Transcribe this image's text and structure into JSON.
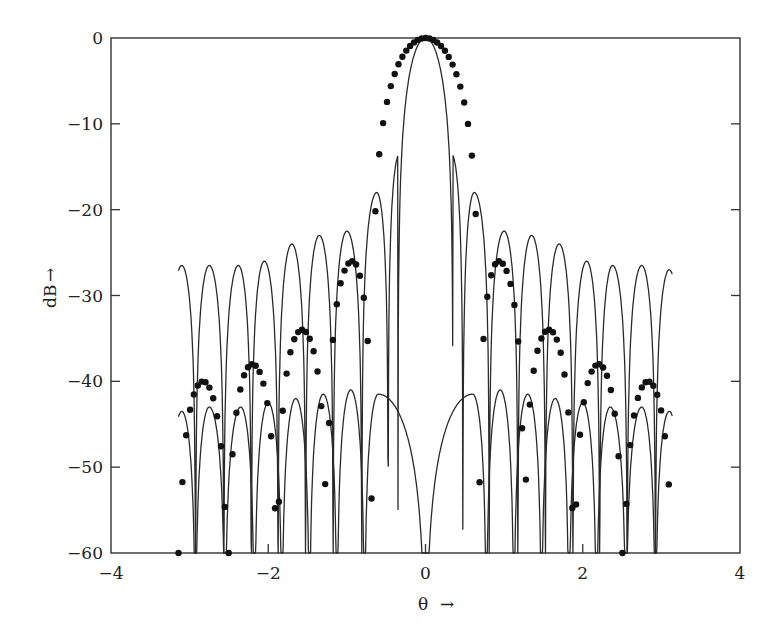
{
  "chart_data": {
    "type": "line",
    "title": "",
    "xlabel": "θ",
    "ylabel": "dB",
    "xlim": [
      -4,
      4
    ],
    "ylim": [
      -60,
      0
    ],
    "x_ticks": [
      -4,
      -2,
      0,
      2,
      4
    ],
    "x_tick_labels": [
      "−4",
      "−2",
      "0",
      "2",
      "4"
    ],
    "y_ticks": [
      0,
      -10,
      -20,
      -30,
      -40,
      -50,
      -60
    ],
    "y_tick_labels": [
      "0",
      "−10",
      "−20",
      "−30",
      "−40",
      "−50",
      "−60"
    ],
    "grid": false,
    "legend": null,
    "x_domain": [
      -3.1416,
      3.1416
    ],
    "floor_db": -60,
    "series": [
      {
        "name": "upper-solid-pattern",
        "style": "line",
        "main_lobe_peak_db": 0,
        "first_null": 0.35,
        "sidelobe_peaks": [
          {
            "theta": -3.1,
            "db": -26.5
          },
          {
            "theta": -2.75,
            "db": -26.5
          },
          {
            "theta": -2.38,
            "db": -26.5
          },
          {
            "theta": -2.05,
            "db": -26.0
          },
          {
            "theta": -1.7,
            "db": -24.0
          },
          {
            "theta": -1.35,
            "db": -23.0
          },
          {
            "theta": -1.0,
            "db": -22.5
          },
          {
            "theta": -0.62,
            "db": -18.0
          },
          {
            "theta": -0.33,
            "db": -13.5
          },
          {
            "theta": 0.33,
            "db": -13.5
          },
          {
            "theta": 0.62,
            "db": -18.0
          },
          {
            "theta": 1.0,
            "db": -22.5
          },
          {
            "theta": 1.35,
            "db": -23.0
          },
          {
            "theta": 1.7,
            "db": -24.0
          },
          {
            "theta": 2.05,
            "db": -26.0
          },
          {
            "theta": 2.38,
            "db": -26.5
          },
          {
            "theta": 2.75,
            "db": -26.5
          },
          {
            "theta": 3.1,
            "db": -27.0
          }
        ]
      },
      {
        "name": "lower-solid-pattern",
        "style": "line",
        "sidelobe_level_db": -42,
        "sidelobe_peaks": [
          {
            "theta": -3.1,
            "db": -43.5
          },
          {
            "theta": -2.75,
            "db": -43.0
          },
          {
            "theta": -2.35,
            "db": -43.0
          },
          {
            "theta": -2.0,
            "db": -42.5
          },
          {
            "theta": -1.65,
            "db": -42.0
          },
          {
            "theta": -1.3,
            "db": -41.5
          },
          {
            "theta": -0.95,
            "db": -41.0
          },
          {
            "theta": -0.6,
            "db": -41.5
          },
          {
            "theta": 0.6,
            "db": -41.5
          },
          {
            "theta": 0.95,
            "db": -41.0
          },
          {
            "theta": 1.3,
            "db": -41.5
          },
          {
            "theta": 1.65,
            "db": -42.0
          },
          {
            "theta": 2.0,
            "db": -42.5
          },
          {
            "theta": 2.35,
            "db": -43.0
          },
          {
            "theta": 2.75,
            "db": -43.0
          },
          {
            "theta": 3.1,
            "db": -43.5
          }
        ]
      },
      {
        "name": "dotted-pattern",
        "style": "markers",
        "main_lobe_peak_db": 0,
        "first_null": 0.68,
        "sidelobe_peaks": [
          {
            "theta": -2.83,
            "db": -40.0
          },
          {
            "theta": -2.2,
            "db": -38.0
          },
          {
            "theta": -1.57,
            "db": -34.0
          },
          {
            "theta": -0.93,
            "db": -26.0
          },
          {
            "theta": 0.93,
            "db": -26.0
          },
          {
            "theta": 1.57,
            "db": -34.0
          },
          {
            "theta": 2.2,
            "db": -38.0
          },
          {
            "theta": 2.83,
            "db": -40.0
          }
        ]
      }
    ]
  },
  "axes": {
    "x_label": "θ",
    "x_arrow": "→",
    "y_label": "dB",
    "y_arrow": "→"
  },
  "colors": {
    "line": "#2a2a2a",
    "marker": "#111111",
    "axis": "#333333",
    "background": "#ffffff"
  }
}
